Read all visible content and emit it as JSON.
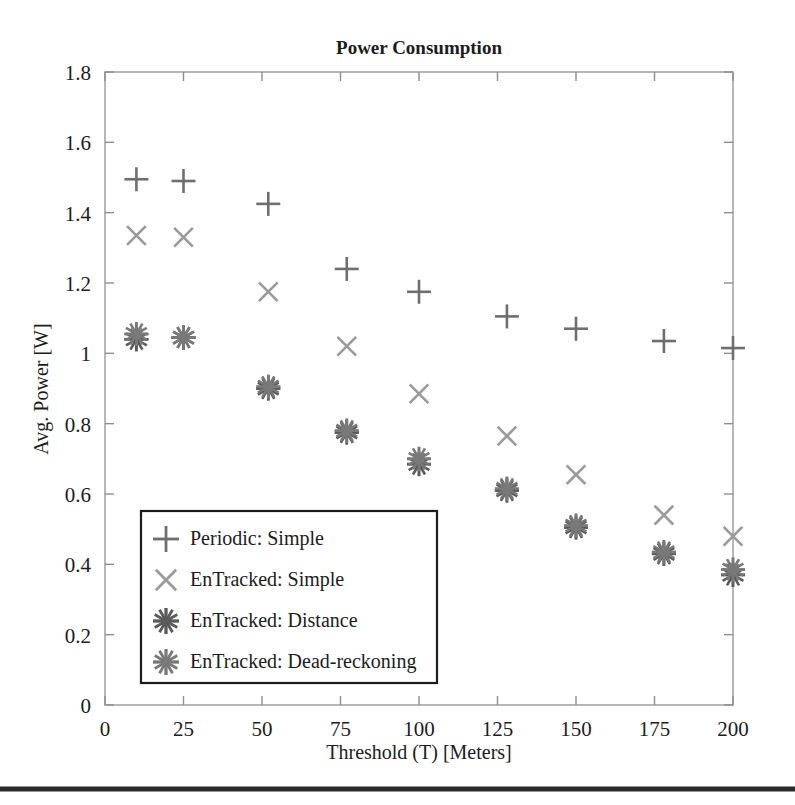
{
  "chart_data": {
    "type": "scatter",
    "title": "Power Consumption",
    "xlabel": "Threshold (T) [Meters]",
    "ylabel": "Avg. Power [W]",
    "xlim": [
      0,
      200
    ],
    "ylim": [
      0,
      1.8
    ],
    "xticks": [
      0,
      25,
      50,
      75,
      100,
      125,
      150,
      175,
      200
    ],
    "xtick_labels": [
      "0",
      "25",
      "50",
      "75",
      "100",
      "125",
      "150",
      "175",
      "200"
    ],
    "yticks": [
      0,
      0.2,
      0.4,
      0.6,
      0.8,
      1,
      1.2,
      1.4,
      1.6,
      1.8
    ],
    "ytick_labels": [
      "0",
      "0.2",
      "0.4",
      "0.6",
      "0.8",
      "1",
      "1.2",
      "1.4",
      "1.6",
      "1.8"
    ],
    "grid": false,
    "legend_position": "lower-left",
    "series": [
      {
        "name": "Periodic: Simple",
        "marker": "plus",
        "color": "#6e6e6e",
        "x": [
          10,
          25,
          52,
          77,
          100,
          128,
          150,
          178,
          200
        ],
        "y": [
          1.495,
          1.49,
          1.425,
          1.24,
          1.175,
          1.105,
          1.07,
          1.035,
          1.015
        ]
      },
      {
        "name": "EnTracked: Simple",
        "marker": "cross",
        "color": "#9a9a9a",
        "x": [
          10,
          25,
          52,
          77,
          100,
          128,
          150,
          178,
          200
        ],
        "y": [
          1.335,
          1.33,
          1.175,
          1.02,
          0.885,
          0.765,
          0.655,
          0.54,
          0.48
        ]
      },
      {
        "name": "EnTracked: Distance",
        "marker": "asterisk",
        "color": "#5a5a5a",
        "x": [
          10,
          25,
          52,
          77,
          100,
          128,
          150,
          178,
          200
        ],
        "y": [
          1.04,
          1.045,
          0.9,
          0.775,
          0.685,
          0.61,
          0.505,
          0.43,
          0.37
        ]
      },
      {
        "name": "EnTracked: Dead-reckoning",
        "marker": "asterisk",
        "color": "#797979",
        "x": [
          10,
          25,
          52,
          77,
          100,
          128,
          150,
          178,
          200
        ],
        "y": [
          1.055,
          1.045,
          0.905,
          0.78,
          0.7,
          0.615,
          0.51,
          0.435,
          0.385
        ]
      }
    ]
  },
  "figure": {
    "title": "Power Consumption",
    "xlabel": "Threshold (T) [Meters]",
    "ylabel": "Avg. Power [W]"
  },
  "legend": {
    "entries": [
      {
        "label": "Periodic: Simple",
        "marker": "plus-marker-icon"
      },
      {
        "label": "EnTracked: Simple",
        "marker": "cross-marker-icon"
      },
      {
        "label": "EnTracked: Distance",
        "marker": "asterisk-marker-icon"
      },
      {
        "label": "EnTracked: Dead-reckoning",
        "marker": "asterisk-marker-icon"
      }
    ]
  }
}
